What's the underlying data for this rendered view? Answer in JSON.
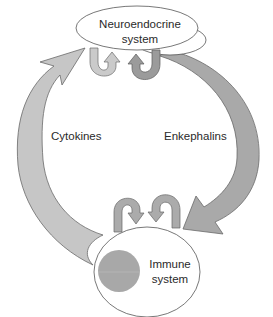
{
  "diagram": {
    "nodes": {
      "neuroendocrine": {
        "line1": "Neuroendocrine",
        "line2": "system"
      },
      "immune": {
        "line1": "Immune",
        "line2": "system"
      }
    },
    "edges": {
      "cytokines": {
        "label": "Cytokines",
        "from": "immune",
        "to": "neuroendocrine"
      },
      "enkephalins": {
        "label": "Enkephalins",
        "from": "neuroendocrine",
        "to": "immune"
      }
    },
    "self_loops": {
      "neuroendocrine": [
        "light-loop",
        "dark-loop"
      ],
      "immune": [
        "left-loop",
        "right-loop"
      ]
    }
  },
  "colors": {
    "background": "#ffffff",
    "cytokines_arrow": "#c6c6c6",
    "enkephalins_arrow": "#a9a9a9",
    "loop_light": "#cacaca",
    "loop_dark": "#9b9b9b",
    "loop_bottom": "#ababab",
    "nucleus": "#a8a8a8",
    "outline": "#555555"
  }
}
